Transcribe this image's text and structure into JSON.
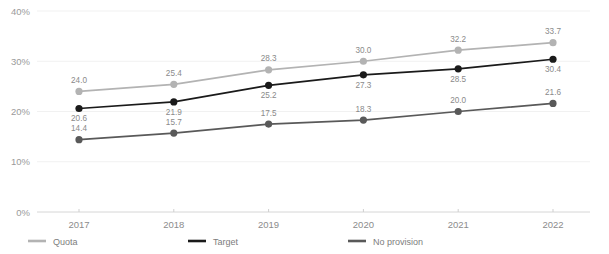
{
  "chart_data": {
    "type": "line",
    "title": "",
    "xlabel": "",
    "ylabel": "",
    "categories": [
      "2017",
      "2018",
      "2019",
      "2020",
      "2021",
      "2022"
    ],
    "ylim": [
      0,
      40
    ],
    "yticks": [
      "0%",
      "10%",
      "20%",
      "30%",
      "40%"
    ],
    "ytick_values": [
      0,
      10,
      20,
      30,
      40
    ],
    "grid": true,
    "legend_position": "bottom-left",
    "series": [
      {
        "name": "Quota",
        "color": "#b3b3b3",
        "values": [
          24.0,
          25.4,
          28.3,
          30.0,
          32.2,
          33.7
        ],
        "labels": [
          "24.0",
          "25.4",
          "28.3",
          "30.0",
          "32.2",
          "33.7"
        ],
        "label_positions": [
          "above",
          "above",
          "above",
          "above",
          "above",
          "above"
        ]
      },
      {
        "name": "Target",
        "color": "#1a1a1a",
        "values": [
          20.6,
          21.9,
          25.2,
          27.3,
          28.5,
          30.4
        ],
        "labels": [
          "20.6",
          "21.9",
          "25.2",
          "27.3",
          "28.5",
          "30.4"
        ],
        "label_positions": [
          "below",
          "below",
          "below",
          "below",
          "below",
          "below"
        ]
      },
      {
        "name": "No provision",
        "color": "#595959",
        "values": [
          14.4,
          15.7,
          17.5,
          18.3,
          20.0,
          21.6
        ],
        "labels": [
          "14.4",
          "15.7",
          "17.5",
          "18.3",
          "20.0",
          "21.6"
        ],
        "label_positions": [
          "above",
          "above",
          "above",
          "above",
          "above",
          "above"
        ]
      }
    ]
  },
  "legend": {
    "items": [
      {
        "label": "Quota",
        "color": "#b3b3b3"
      },
      {
        "label": "Target",
        "color": "#1a1a1a"
      },
      {
        "label": "No provision",
        "color": "#595959"
      }
    ]
  }
}
